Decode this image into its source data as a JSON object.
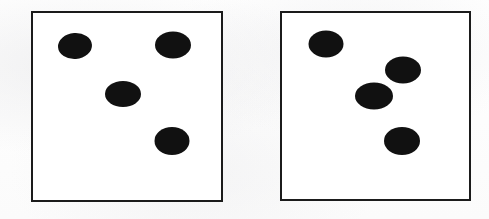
{
  "figure": {
    "caption": "",
    "type": "dot-pattern-comparison",
    "background_color": "#fdfdfd",
    "ink_color": "#111111",
    "border_color": "#1b1b1b",
    "border_width_px": 2,
    "canvas": {
      "width": 489,
      "height": 219
    }
  },
  "ghost_text": {
    "line_1": "",
    "line_2": ""
  },
  "panels": [
    {
      "id": "left",
      "name": "left-stimulus-panel",
      "label": "",
      "dot_count": 4,
      "frame": {
        "x": 31,
        "y": 11,
        "width": 192,
        "height": 191
      },
      "dots": [
        {
          "id": "left-dot-1",
          "cx": 75,
          "cy": 46,
          "rx": 17.0,
          "ry": 13.0,
          "rotation": -4
        },
        {
          "id": "left-dot-2",
          "cx": 173,
          "cy": 45,
          "rx": 18.0,
          "ry": 13.5,
          "rotation": 0
        },
        {
          "id": "left-dot-3",
          "cx": 123,
          "cy": 94,
          "rx": 18.0,
          "ry": 13.0,
          "rotation": 0
        },
        {
          "id": "left-dot-4",
          "cx": 172,
          "cy": 141,
          "rx": 17.5,
          "ry": 14.0,
          "rotation": 0
        }
      ]
    },
    {
      "id": "right",
      "name": "right-stimulus-panel",
      "label": "",
      "dot_count": 4,
      "frame": {
        "x": 280,
        "y": 11,
        "width": 191,
        "height": 190
      },
      "dots": [
        {
          "id": "right-dot-1",
          "cx": 326,
          "cy": 44,
          "rx": 17.5,
          "ry": 13.5,
          "rotation": 0
        },
        {
          "id": "right-dot-2",
          "cx": 403,
          "cy": 70,
          "rx": 18.0,
          "ry": 13.5,
          "rotation": 0
        },
        {
          "id": "right-dot-3",
          "cx": 374,
          "cy": 96,
          "rx": 19.0,
          "ry": 13.5,
          "rotation": 0
        },
        {
          "id": "right-dot-4",
          "cx": 402,
          "cy": 141,
          "rx": 18.0,
          "ry": 14.0,
          "rotation": 0
        }
      ]
    }
  ],
  "chart_data": {
    "type": "scatter",
    "title": "",
    "subtitle": "",
    "xlabel": "",
    "ylabel": "",
    "grid": false,
    "legend": null,
    "xlim": [
      0,
      489
    ],
    "ylim": [
      219,
      0
    ],
    "annotations": [],
    "series": [
      {
        "name": "left-panel-dots",
        "marker": "filled-ellipse",
        "color": "#111111",
        "x": [
          75,
          173,
          123,
          172
        ],
        "y": [
          46,
          45,
          94,
          141
        ]
      },
      {
        "name": "right-panel-dots",
        "marker": "filled-ellipse",
        "color": "#111111",
        "x": [
          326,
          403,
          374,
          402
        ],
        "y": [
          44,
          70,
          96,
          141
        ]
      }
    ]
  }
}
